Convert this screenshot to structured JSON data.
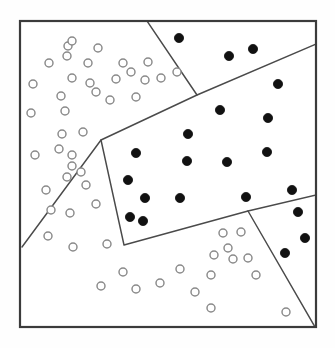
{
  "figure": {
    "title": "",
    "frame": {
      "x": 20,
      "y": 21,
      "width": 296,
      "height": 306
    },
    "colors": {
      "frame_stroke": "#3b3b3b",
      "line_stroke": "#4a4a4a",
      "open_point_stroke": "#8a8a8a",
      "open_point_fill": "#ffffff",
      "filled_point_fill": "#111111",
      "background": "#ffffff"
    }
  },
  "chart_data": {
    "type": "scatter",
    "title": "",
    "subtitle": "",
    "xlabel": "",
    "ylabel": "",
    "xlim": [
      20,
      316
    ],
    "ylim": [
      21,
      327
    ],
    "grid": false,
    "legend": {
      "show": false,
      "position": "none"
    },
    "annotations": [],
    "axis_ticks": {
      "x": [],
      "y": []
    },
    "series": [
      {
        "name": "class-open",
        "marker": "open-circle",
        "marker_radius": 4.0,
        "color": "#ffffff",
        "edge_color": "#8a8a8a",
        "count": 54,
        "points": [
          [
            68,
            46
          ],
          [
            72,
            41
          ],
          [
            67,
            56
          ],
          [
            98,
            48
          ],
          [
            49,
            63
          ],
          [
            88,
            63
          ],
          [
            123,
            63
          ],
          [
            148,
            62
          ],
          [
            33,
            84
          ],
          [
            72,
            78
          ],
          [
            90,
            83
          ],
          [
            116,
            79
          ],
          [
            131,
            72
          ],
          [
            145,
            80
          ],
          [
            161,
            78
          ],
          [
            177,
            72
          ],
          [
            61,
            96
          ],
          [
            96,
            92
          ],
          [
            110,
            100
          ],
          [
            136,
            97
          ],
          [
            31,
            113
          ],
          [
            65,
            111
          ],
          [
            62,
            134
          ],
          [
            83,
            132
          ],
          [
            59,
            149
          ],
          [
            35,
            155
          ],
          [
            72,
            155
          ],
          [
            72,
            166
          ],
          [
            67,
            177
          ],
          [
            81,
            172
          ],
          [
            46,
            190
          ],
          [
            86,
            185
          ],
          [
            51,
            210
          ],
          [
            70,
            213
          ],
          [
            96,
            204
          ],
          [
            48,
            236
          ],
          [
            73,
            247
          ],
          [
            107,
            244
          ],
          [
            123,
            272
          ],
          [
            101,
            286
          ],
          [
            136,
            289
          ],
          [
            160,
            283
          ],
          [
            180,
            269
          ],
          [
            195,
            292
          ],
          [
            211,
            275
          ],
          [
            214,
            255
          ],
          [
            223,
            233
          ],
          [
            228,
            248
          ],
          [
            233,
            259
          ],
          [
            241,
            232
          ],
          [
            248,
            258
          ],
          [
            256,
            275
          ],
          [
            211,
            308
          ],
          [
            286,
            312
          ]
        ]
      },
      {
        "name": "class-filled",
        "marker": "filled-circle",
        "marker_radius": 4.6,
        "color": "#111111",
        "edge_color": "#111111",
        "count": 25,
        "points": [
          [
            179,
            38
          ],
          [
            229,
            56
          ],
          [
            253,
            49
          ],
          [
            278,
            84
          ],
          [
            220,
            110
          ],
          [
            268,
            118
          ],
          [
            188,
            134
          ],
          [
            136,
            153
          ],
          [
            187,
            161
          ],
          [
            227,
            162
          ],
          [
            267,
            152
          ],
          [
            128,
            180
          ],
          [
            145,
            198
          ],
          [
            180,
            198
          ],
          [
            246,
            197
          ],
          [
            292,
            190
          ],
          [
            130,
            217
          ],
          [
            143,
            221
          ],
          [
            298,
            212
          ],
          [
            305,
            238
          ],
          [
            285,
            253
          ]
        ]
      }
    ],
    "partitions": [
      {
        "name": "upper-vertical-divider",
        "path": [
          [
            147,
            21
          ],
          [
            197,
            95
          ]
        ]
      },
      {
        "name": "main-diagonal-boundary",
        "path": [
          [
            22,
            247
          ],
          [
            101,
            140
          ],
          [
            197,
            95
          ],
          [
            316,
            44
          ]
        ]
      },
      {
        "name": "lower-polygon-edge",
        "path": [
          [
            101,
            140
          ],
          [
            124,
            245
          ],
          [
            248,
            211
          ],
          [
            316,
            195
          ]
        ]
      },
      {
        "name": "lower-right-divider",
        "path": [
          [
            248,
            211
          ],
          [
            315,
            327
          ]
        ]
      }
    ]
  }
}
